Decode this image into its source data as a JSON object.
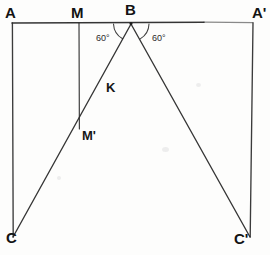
{
  "figure": {
    "type": "geometry-diagram",
    "canvas": {
      "width": 270,
      "height": 255
    },
    "background_color": "#fdfdfc",
    "stroke_color": "#2a2a2a",
    "labels": {
      "A": "A",
      "A_prime": "A'",
      "B": "B",
      "M": "M",
      "M_prime": "M'",
      "K": "K",
      "C": "C",
      "C_prime": "C'"
    },
    "angles": {
      "left": "60°",
      "right": "60°"
    },
    "points": {
      "A": {
        "x": 12,
        "y": 23
      },
      "M": {
        "x": 79,
        "y": 23
      },
      "B": {
        "x": 131,
        "y": 23
      },
      "A_prime": {
        "x": 253,
        "y": 23
      },
      "C": {
        "x": 13,
        "y": 237
      },
      "C_prime": {
        "x": 250,
        "y": 237
      },
      "M_prime": {
        "x": 79,
        "y": 128
      },
      "K": {
        "x": 104,
        "y": 88
      }
    },
    "segments": [
      {
        "name": "top-edge-A-to-Aprime",
        "from": "A",
        "to": "A_prime"
      },
      {
        "name": "left-edge-A-to-C",
        "from": "A",
        "to": "C"
      },
      {
        "name": "right-edge-Aprime-to-Cprime",
        "from": "A_prime",
        "to": "C_prime"
      },
      {
        "name": "altitude-M-to-Mprime",
        "from": "M",
        "to": "M_prime"
      },
      {
        "name": "ray-B-to-C",
        "from": "B",
        "to": "C"
      },
      {
        "name": "ray-B-to-Cprime",
        "from": "B",
        "to": "C_prime"
      }
    ]
  }
}
